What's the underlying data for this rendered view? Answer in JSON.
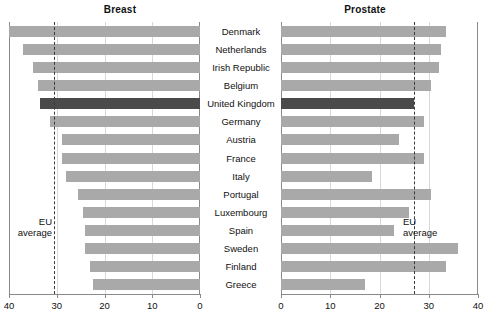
{
  "chart_data": {
    "type": "bar",
    "title": "",
    "orientation": "horizontal",
    "panels": [
      {
        "title": "Breast",
        "xlabel": "",
        "ylabel": "",
        "xlim": [
          40,
          0
        ],
        "direction": "reversed",
        "ticks": [
          40,
          30,
          20,
          10,
          0
        ],
        "grid": true,
        "eu_average": 30.5,
        "eu_average_label": "EU\naverage",
        "values": [
          40.0,
          37.0,
          35.0,
          34.0,
          33.5,
          31.5,
          29.0,
          29.0,
          28.0,
          25.5,
          24.5,
          24.0,
          24.0,
          23.0,
          22.5
        ]
      },
      {
        "title": "Prostate",
        "xlabel": "",
        "ylabel": "",
        "xlim": [
          0,
          40
        ],
        "direction": "normal",
        "ticks": [
          0,
          10,
          20,
          30,
          40
        ],
        "grid": true,
        "eu_average": 27.0,
        "eu_average_label": "EU\naverage",
        "values": [
          33.5,
          32.5,
          32.0,
          30.5,
          27.0,
          29.0,
          24.0,
          29.0,
          18.5,
          30.5,
          26.0,
          23.0,
          36.0,
          33.5,
          17.0
        ]
      }
    ],
    "categories": [
      "Denmark",
      "Netherlands",
      "Irish Republic",
      "Belgium",
      "United Kingdom",
      "Germany",
      "Austria",
      "France",
      "Italy",
      "Portugal",
      "Luxembourg",
      "Spain",
      "Sweden",
      "Finland",
      "Greece"
    ],
    "highlight_category": "United Kingdom",
    "colors": {
      "bar": "#a9a9a9",
      "highlight_bar": "#4a4a4a",
      "grid": "#d8d8d8",
      "axis": "#8a8a8a",
      "eu_line": "#3a3a3a",
      "text": "#111111",
      "background": "#ffffff"
    }
  },
  "eu_average_text": {
    "line1": "EU",
    "line2": "average"
  }
}
